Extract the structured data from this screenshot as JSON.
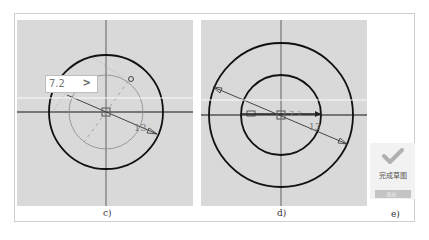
{
  "figure": {
    "panels": [
      {
        "id": "c",
        "caption": "c)",
        "input_value": "7.2",
        "input_arrow": ">",
        "dimension_label": "13",
        "shapes": [
          "outer-circle",
          "construction-circle-dashed",
          "center-point",
          "radius-dimension-line"
        ]
      },
      {
        "id": "d",
        "caption": "d)",
        "inner_dimension_label": "7.2",
        "outer_dimension_label": "13",
        "shapes": [
          "outer-circle",
          "inner-circle",
          "center-point",
          "diameter-dimension-line",
          "inner-radius-dimension"
        ]
      },
      {
        "id": "e",
        "caption": "e)",
        "finish_label": "完成草图",
        "finish_button_label": "退出",
        "icon": "check-icon"
      }
    ]
  },
  "colors": {
    "canvas": "#d9d9d9",
    "sketch": "#111111",
    "axis": "#555555",
    "construction": "#777777",
    "check": "#b0b0b0"
  }
}
